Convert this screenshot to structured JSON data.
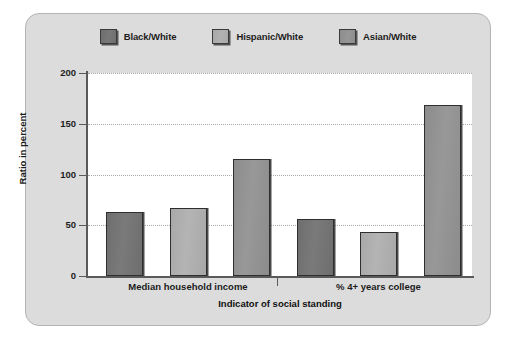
{
  "chart_data": {
    "type": "bar",
    "title": "",
    "xlabel": "Indicator of social standing",
    "ylabel": "Ratio in percent",
    "categories": [
      "Median household income",
      "% 4+ years college"
    ],
    "series": [
      {
        "name": "Black/White",
        "color": "#6e6e6e",
        "values": [
          63,
          56
        ]
      },
      {
        "name": "Hispanic/White",
        "color": "#a8a8a8",
        "values": [
          67,
          43
        ]
      },
      {
        "name": "Asian/White",
        "color": "#8c8c8c",
        "values": [
          115,
          168
        ]
      }
    ],
    "ylim": [
      0,
      200
    ],
    "yticks": [
      0,
      50,
      100,
      150,
      200
    ],
    "ytick_labels": [
      "0",
      "50",
      "100",
      "150",
      "200"
    ],
    "grid": true,
    "legend_position": "top"
  },
  "legend": {
    "items": [
      {
        "label": "Black/White"
      },
      {
        "label": "Hispanic/White"
      },
      {
        "label": "Asian/White"
      }
    ]
  },
  "axes": {
    "y_title": "Ratio in percent",
    "x_title": "Indicator of social standing"
  },
  "colors": {
    "panel_background": "#dcdcdc",
    "plot_background": "#ffffff",
    "axis": "#5a5a5a",
    "gridline": "#a8a8a8",
    "text": "#1c1c1c"
  }
}
